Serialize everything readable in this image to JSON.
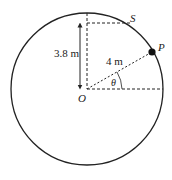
{
  "diagram": {
    "labels": {
      "height": "3.8 m",
      "radius": "4 m",
      "angle": "θ",
      "center": "O",
      "point_p": "P",
      "point_s": "S"
    },
    "values": {
      "radius_m": 4,
      "height_m": 3.8
    },
    "colors": {
      "stroke": "#222222",
      "background": "#ffffff"
    }
  }
}
